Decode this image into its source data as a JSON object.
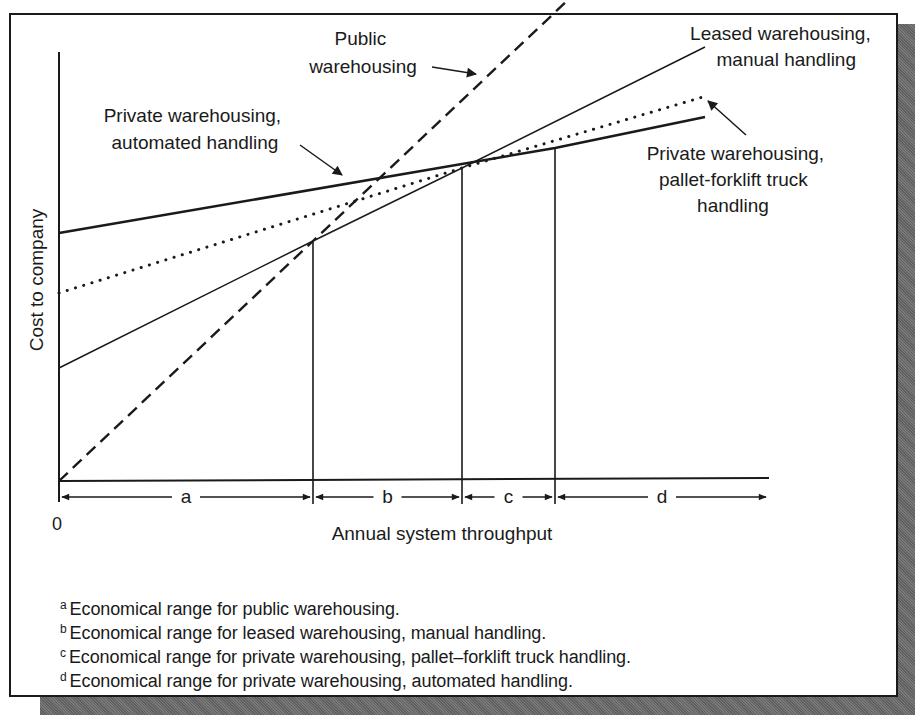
{
  "chart_data": {
    "type": "line",
    "title": "",
    "xlabel": "Annual system throughput",
    "ylabel": "Cost to company",
    "x_tick_labels": [
      "0"
    ],
    "grid": false,
    "legend_position": "inline annotations with arrows",
    "series": [
      {
        "name": "Public warehousing",
        "style": "dashed",
        "points": [
          [
            0,
            0
          ],
          [
            254,
            240
          ],
          [
            509,
            481
          ]
        ]
      },
      {
        "name": "Leased warehousing, manual handling",
        "style": "solid-thin",
        "points": [
          [
            0,
            113
          ],
          [
            254,
            240
          ],
          [
            403,
            313
          ],
          [
            646,
            434
          ]
        ]
      },
      {
        "name": "Private warehousing, pallet-forklift truck handling",
        "style": "dotted",
        "points": [
          [
            0,
            188
          ],
          [
            403,
            313
          ],
          [
            644,
            384
          ]
        ]
      },
      {
        "name": "Private warehousing, automated handling",
        "style": "solid-thick",
        "points": [
          [
            0,
            248
          ],
          [
            496,
            333
          ],
          [
            646,
            364
          ]
        ]
      }
    ],
    "breakpoints_x": [
      254,
      403,
      496
    ],
    "ranges": [
      {
        "label": "a",
        "from": 0,
        "to": 254,
        "meaning": "Economical range for public warehousing."
      },
      {
        "label": "b",
        "from": 254,
        "to": 403,
        "meaning": "Economical range for leased warehousing, manual handling."
      },
      {
        "label": "c",
        "from": 403,
        "to": 496,
        "meaning": "Economical range for private warehousing, pallet–forklift truck handling."
      },
      {
        "label": "d",
        "from": 496,
        "to": 710,
        "meaning": "Economical range for private warehousing, automated handling."
      }
    ],
    "units_note": "Schematic chart without numeric scale; values are in relative pixel units from origin."
  },
  "annotations": {
    "public": [
      "Public",
      "warehousing"
    ],
    "leased": [
      "Leased warehousing,",
      "manual handling"
    ],
    "automated": [
      "Private warehousing,",
      "automated handling"
    ],
    "pallet": [
      "Private warehousing,",
      "pallet-forklift truck",
      "handling"
    ]
  },
  "axis": {
    "origin_label": "0",
    "x_label": "Annual system throughput",
    "y_label": "Cost to company"
  },
  "range_labels": [
    "a",
    "b",
    "c",
    "d"
  ],
  "footnotes": [
    {
      "mark": "a",
      "text": "Economical range for public warehousing."
    },
    {
      "mark": "b",
      "text": "Economical range for leased warehousing, manual handling."
    },
    {
      "mark": "c",
      "text": "Economical range for private warehousing, pallet–forklift truck handling."
    },
    {
      "mark": "d",
      "text": "Economical range for private warehousing, automated handling."
    }
  ],
  "colors": {
    "ink": "#1a1a1a",
    "background": "#ffffff",
    "shadow": "#6e6e6e"
  }
}
